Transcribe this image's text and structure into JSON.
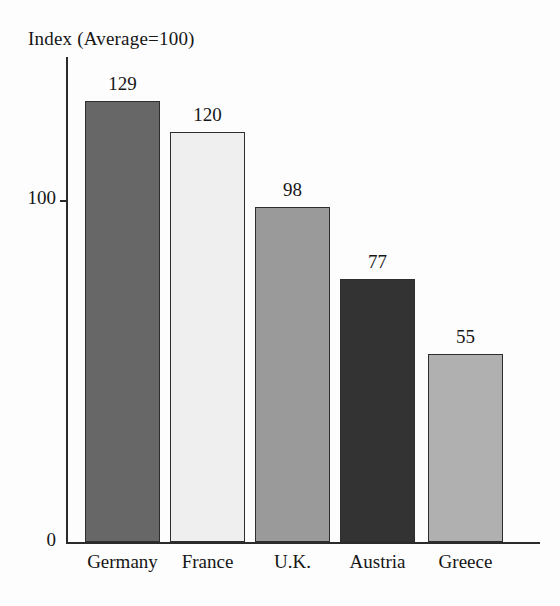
{
  "chart_data": {
    "type": "bar",
    "title": "Index (Average=100)",
    "xlabel": "",
    "ylabel": "",
    "categories": [
      "Germany",
      "France",
      "U.K.",
      "Austria",
      "Greece"
    ],
    "values": [
      129,
      120,
      98,
      77,
      55
    ],
    "value_labels": [
      "129",
      "120",
      "98",
      "77",
      "55"
    ],
    "ytick_labels": [
      "0",
      "100"
    ],
    "ytick_values": [
      0,
      100
    ],
    "ylim": [
      0,
      142
    ],
    "grid": false,
    "legend": false,
    "bar_colors": [
      "#676767",
      "#efefef",
      "#9a9a9a",
      "#333333",
      "#b0b0b0"
    ],
    "bar_border_color": "#2e2e2e",
    "axis_color": "#2b2b2b",
    "text_color": "#161616",
    "background": "#fdfdfd"
  }
}
